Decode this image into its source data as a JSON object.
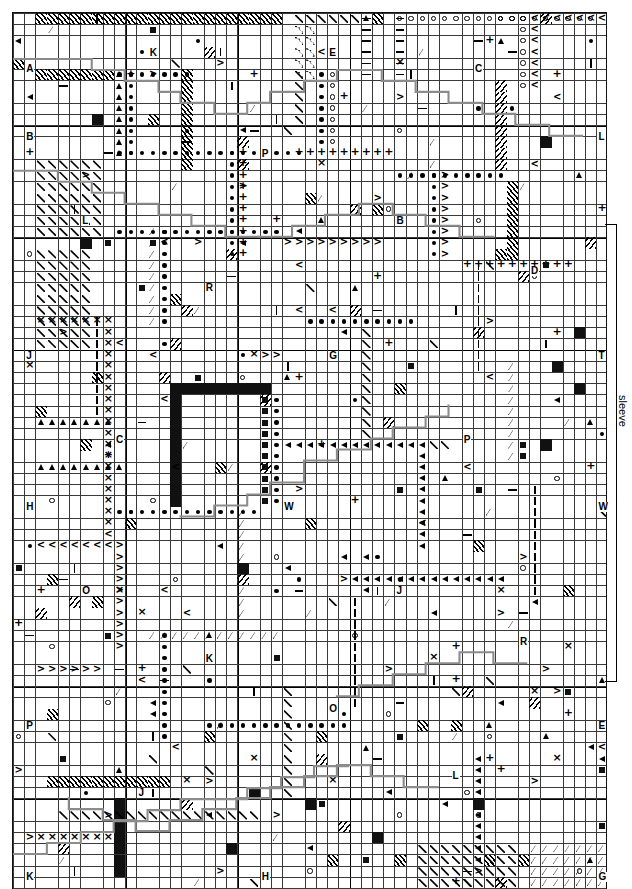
{
  "chart": {
    "kind": "cross-stitch-pattern-chart",
    "title": "",
    "grid": {
      "cell_px": 11.22,
      "origin_x": 12,
      "origin_y": 12,
      "cols": 53,
      "rows": 78,
      "fine_line_color": "#3a3a3a",
      "heavy_line_color": "#000000",
      "heavy_every": 10,
      "background": "#ffffff"
    },
    "annotations": {
      "sleeve_label": "sleeve",
      "bracket_color": "#000000"
    },
    "backstitch": {
      "color": "#8c8c8c",
      "description": "stepped grey outline lines tracing garment seams across the chart"
    },
    "symbol_legend": [
      {
        "key": "dot",
        "glyph": "●",
        "name": "filled-dot"
      },
      {
        "key": "circle",
        "glyph": "○",
        "name": "open-circle"
      },
      {
        "key": "fill",
        "glyph": "■",
        "name": "solid-square"
      },
      {
        "key": "smsq",
        "glyph": "▪",
        "name": "small-square"
      },
      {
        "key": "x",
        "glyph": "×",
        "name": "cross"
      },
      {
        "key": "plus",
        "glyph": "+",
        "name": "plus"
      },
      {
        "key": "lt",
        "glyph": "<",
        "name": "less-than"
      },
      {
        "key": "gt",
        "glyph": ">",
        "name": "greater-than"
      },
      {
        "key": "tri",
        "glyph": "▲",
        "name": "up-triangle"
      },
      {
        "key": "ltri",
        "glyph": "◄",
        "name": "left-triangle"
      },
      {
        "key": "caret",
        "glyph": "∧",
        "name": "caret"
      },
      {
        "key": "bar",
        "glyph": "|",
        "name": "vertical-bar"
      },
      {
        "key": "dash",
        "glyph": "—",
        "name": "horizontal-dash"
      },
      {
        "key": "lam",
        "glyph": "╲",
        "name": "diagonal-stroke"
      },
      {
        "key": "hatch",
        "glyph": "╱",
        "name": "hatch-fill"
      },
      {
        "key": "hatch2",
        "glyph": "╲",
        "name": "reverse-hatch-fill"
      }
    ],
    "grid_letters": [
      {
        "label": "A",
        "col": 1,
        "row": 3
      },
      {
        "label": "K",
        "col": 12,
        "row": 2
      },
      {
        "label": "E",
        "col": 28,
        "row": 2
      },
      {
        "label": "C",
        "col": 41,
        "row": 3
      },
      {
        "label": "B",
        "col": 1,
        "row": 7
      },
      {
        "label": "L",
        "col": 52,
        "row": 7
      },
      {
        "label": "P",
        "col": 22,
        "row": 8
      },
      {
        "label": "L",
        "col": 6,
        "row": 12
      },
      {
        "label": "B",
        "col": 34,
        "row": 12
      },
      {
        "label": "D",
        "col": 46,
        "row": 15
      },
      {
        "label": "R",
        "col": 17,
        "row": 16
      },
      {
        "label": "J",
        "col": 1,
        "row": 20
      },
      {
        "label": "G",
        "col": 28,
        "row": 20
      },
      {
        "label": "T",
        "col": 52,
        "row": 20
      },
      {
        "label": "C",
        "col": 9,
        "row": 25
      },
      {
        "label": "P",
        "col": 40,
        "row": 25
      },
      {
        "label": "H",
        "col": 1,
        "row": 29
      },
      {
        "label": "W",
        "col": 24,
        "row": 29
      },
      {
        "label": "W",
        "col": 52,
        "row": 29
      },
      {
        "label": "O",
        "col": 6,
        "row": 34
      },
      {
        "label": "J",
        "col": 34,
        "row": 34
      },
      {
        "label": "K",
        "col": 17,
        "row": 38
      },
      {
        "label": "R",
        "col": 45,
        "row": 37
      },
      {
        "label": "P",
        "col": 1,
        "row": 42
      },
      {
        "label": "O",
        "col": 28,
        "row": 41
      },
      {
        "label": "E",
        "col": 52,
        "row": 42
      },
      {
        "label": "J",
        "col": 11,
        "row": 46
      },
      {
        "label": "L",
        "col": 39,
        "row": 45
      },
      {
        "label": "K",
        "col": 1,
        "row": 51
      },
      {
        "label": "H",
        "col": 22,
        "row": 51
      },
      {
        "label": "G",
        "col": 52,
        "row": 51
      },
      {
        "label": "M",
        "col": 6,
        "row": 55
      },
      {
        "label": "S",
        "col": 34,
        "row": 55
      },
      {
        "label": "B",
        "col": 17,
        "row": 61
      },
      {
        "label": "O",
        "col": 44,
        "row": 61
      },
      {
        "label": "N",
        "col": 1,
        "row": 65
      },
      {
        "label": "J",
        "col": 28,
        "row": 64
      },
      {
        "label": "C",
        "col": 52,
        "row": 65
      },
      {
        "label": "L",
        "col": 11,
        "row": 69
      },
      {
        "label": "T",
        "col": 37,
        "row": 69
      },
      {
        "label": "B",
        "col": 1,
        "row": 74
      },
      {
        "label": "E",
        "col": 6,
        "row": 76
      },
      {
        "label": "G",
        "col": 24,
        "row": 74
      },
      {
        "label": "M",
        "col": 38,
        "row": 76
      },
      {
        "label": "H",
        "col": 52,
        "row": 74
      }
    ]
  }
}
